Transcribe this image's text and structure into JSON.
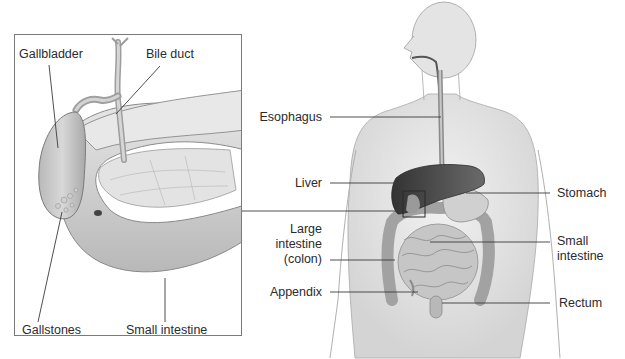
{
  "figure": {
    "inset": {
      "description": "Enlarged view of gallbladder region",
      "labels": [
        {
          "id": "gallbladder",
          "text": "Gallbladder"
        },
        {
          "id": "bile-duct",
          "text": "Bile duct"
        },
        {
          "id": "gallstones",
          "text": "Gallstones"
        },
        {
          "id": "small-intestine-inset",
          "text": "Small intestine"
        }
      ]
    },
    "body_labels": {
      "left": [
        {
          "id": "esophagus",
          "text": "Esophagus"
        },
        {
          "id": "liver",
          "text": "Liver"
        },
        {
          "id": "large-intestine",
          "lines": [
            "Large",
            "intestine",
            "(colon)"
          ]
        },
        {
          "id": "appendix",
          "text": "Appendix"
        }
      ],
      "right": [
        {
          "id": "stomach",
          "text": "Stomach"
        },
        {
          "id": "small-intestine",
          "lines": [
            "Small",
            "intestine"
          ]
        },
        {
          "id": "rectum",
          "text": "Rectum"
        }
      ]
    },
    "colors": {
      "skin": "#e9e9e9",
      "skin_edge": "#9a9a9a",
      "liver": "#4a4a4a",
      "intestine": "#bdbdbd",
      "leader_line": "#3a3a3a",
      "inset_border": "#7a7a7a"
    }
  }
}
